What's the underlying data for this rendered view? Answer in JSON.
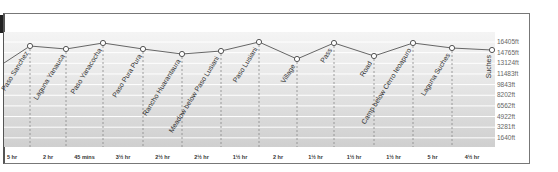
{
  "chart_data": {
    "type": "line",
    "title": "",
    "xlabel": "",
    "ylabel": "Elevation",
    "ylim": [
      0,
      17400
    ],
    "y_ticks": [
      "16405ft",
      "14765ft",
      "13124ft",
      "11483ft",
      "9843ft",
      "8202ft",
      "6562ft",
      "4922ft",
      "3281ft",
      "1640ft"
    ],
    "grid": true,
    "start_elevation_ft": 13100,
    "waypoints": [
      {
        "name": "Paso Sanchez",
        "elevation_ft": 15700,
        "x": 30,
        "y": 46
      },
      {
        "name": "Laguna Yanauca",
        "elevation_ft": 15300,
        "x": 66,
        "y": 49
      },
      {
        "name": "Paso Yanacocha",
        "elevation_ft": 16200,
        "x": 103,
        "y": 43
      },
      {
        "name": "Paso Pura Pura",
        "elevation_ft": 15300,
        "x": 143,
        "y": 49
      },
      {
        "name": "Rancho Huarantaura",
        "elevation_ft": 14500,
        "x": 182,
        "y": 54
      },
      {
        "name": "Meadow below Paso Lusiani",
        "elevation_ft": 15000,
        "x": 221,
        "y": 51
      },
      {
        "name": "Paso Lusiani",
        "elevation_ft": 16400,
        "x": 259,
        "y": 42
      },
      {
        "name": "Village",
        "elevation_ft": 13800,
        "x": 297,
        "y": 59
      },
      {
        "name": "Pass",
        "elevation_ft": 16200,
        "x": 334,
        "y": 43
      },
      {
        "name": "Road",
        "elevation_ft": 14300,
        "x": 374,
        "y": 56
      },
      {
        "name": "Camp below Cerro Ieoapuro",
        "elevation_ft": 16200,
        "x": 413,
        "y": 43
      },
      {
        "name": "Laguna Suches",
        "elevation_ft": 15500,
        "x": 452,
        "y": 48
      },
      {
        "name": "Suches",
        "elevation_ft": 15200,
        "x": 492,
        "y": 50
      }
    ],
    "segment_times": [
      "5 hr",
      "2 hr",
      "45 mins",
      "3½ hr",
      "2½ hr",
      "2½ hr",
      "1½ hr",
      "2 hr",
      "1½ hr",
      "1½ hr",
      "1½ hr",
      "5 hr",
      "4½ hr"
    ],
    "colors": {
      "line": "#666666",
      "marker_fill": "#ffffff",
      "marker_stroke": "#555555",
      "grid": "#ffffff",
      "dashed": "#888888"
    }
  }
}
